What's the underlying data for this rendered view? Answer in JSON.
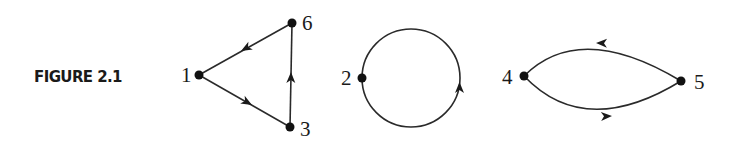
{
  "figure": {
    "caption": "FIGURE 2.1",
    "graphs": [
      {
        "name": "triangle-cycle",
        "nodes": [
          {
            "id": "1",
            "label": "1"
          },
          {
            "id": "6",
            "label": "6"
          },
          {
            "id": "3",
            "label": "3"
          }
        ],
        "edges": [
          {
            "from": "1",
            "to": "3",
            "directed": true
          },
          {
            "from": "3",
            "to": "6",
            "directed": true
          },
          {
            "from": "6",
            "to": "1",
            "directed": true
          }
        ]
      },
      {
        "name": "self-loop",
        "nodes": [
          {
            "id": "2",
            "label": "2"
          }
        ],
        "edges": [
          {
            "from": "2",
            "to": "2",
            "directed": true,
            "shape": "circle",
            "direction": "counterclockwise"
          }
        ]
      },
      {
        "name": "two-cycle",
        "nodes": [
          {
            "id": "4",
            "label": "4"
          },
          {
            "id": "5",
            "label": "5"
          }
        ],
        "edges": [
          {
            "from": "4",
            "to": "5",
            "directed": true,
            "shape": "lower-arc"
          },
          {
            "from": "5",
            "to": "4",
            "directed": true,
            "shape": "upper-arc"
          }
        ]
      }
    ]
  },
  "colors": {
    "ink": "#1a1a1a",
    "background": "#ffffff"
  }
}
